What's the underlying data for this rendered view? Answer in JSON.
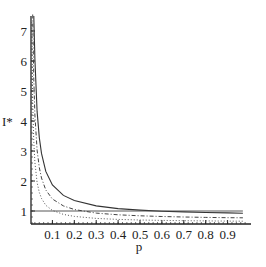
{
  "chart_data": {
    "type": "line",
    "title": "",
    "xlabel": "p",
    "ylabel": "I*",
    "xlim": [
      0.0,
      1.0
    ],
    "ylim": [
      0.5,
      7.5
    ],
    "x_ticks": [
      0.1,
      0.2,
      0.3,
      0.4,
      0.5,
      0.6,
      0.7,
      0.8,
      0.9
    ],
    "x_tick_labels": [
      "0.1",
      "0.2",
      "0.3",
      "0.4",
      "0.5",
      "0.6",
      "0.7",
      "0.8",
      "0.9"
    ],
    "y_ticks": [
      1,
      2,
      3,
      4,
      5,
      6,
      7
    ],
    "y_tick_labels": [
      "1",
      "2",
      "3",
      "4",
      "5",
      "6",
      "7"
    ],
    "grid": false,
    "legend": null,
    "series": [
      {
        "name": "solid",
        "style": "solid",
        "x": [
          0.015,
          0.02,
          0.03,
          0.04,
          0.05,
          0.07,
          0.1,
          0.15,
          0.2,
          0.3,
          0.4,
          0.5,
          0.6,
          0.7,
          0.8,
          0.9,
          0.97
        ],
        "values": [
          7.5,
          6.07,
          4.32,
          3.45,
          2.92,
          2.32,
          1.87,
          1.52,
          1.35,
          1.17,
          1.08,
          1.03,
          0.995,
          0.97,
          0.95,
          0.937,
          0.928
        ]
      },
      {
        "name": "dash-dot",
        "style": "dashdot",
        "x": [
          0.01,
          0.015,
          0.02,
          0.03,
          0.04,
          0.05,
          0.07,
          0.1,
          0.15,
          0.2,
          0.3,
          0.4,
          0.5,
          0.6,
          0.7,
          0.8,
          0.9,
          0.97
        ],
        "values": [
          7.7,
          5.37,
          4.2,
          3.03,
          2.45,
          2.1,
          1.7,
          1.4,
          1.17,
          1.05,
          0.93,
          0.875,
          0.84,
          0.817,
          0.8,
          0.788,
          0.778,
          0.772
        ]
      },
      {
        "name": "dotted",
        "style": "dotted",
        "x": [
          0.006,
          0.01,
          0.015,
          0.02,
          0.03,
          0.04,
          0.05,
          0.07,
          0.1,
          0.15,
          0.2,
          0.3,
          0.4,
          0.5,
          0.6,
          0.7,
          0.8,
          0.9,
          0.97
        ],
        "values": [
          7.3,
          4.62,
          3.29,
          2.62,
          1.95,
          1.62,
          1.42,
          1.19,
          1.02,
          0.887,
          0.82,
          0.753,
          0.72,
          0.7,
          0.687,
          0.677,
          0.67,
          0.664,
          0.661
        ]
      },
      {
        "name": "reference-line",
        "style": "solid-thin",
        "x": [
          0.0,
          0.97
        ],
        "values": [
          1.0,
          1.0
        ]
      }
    ]
  }
}
